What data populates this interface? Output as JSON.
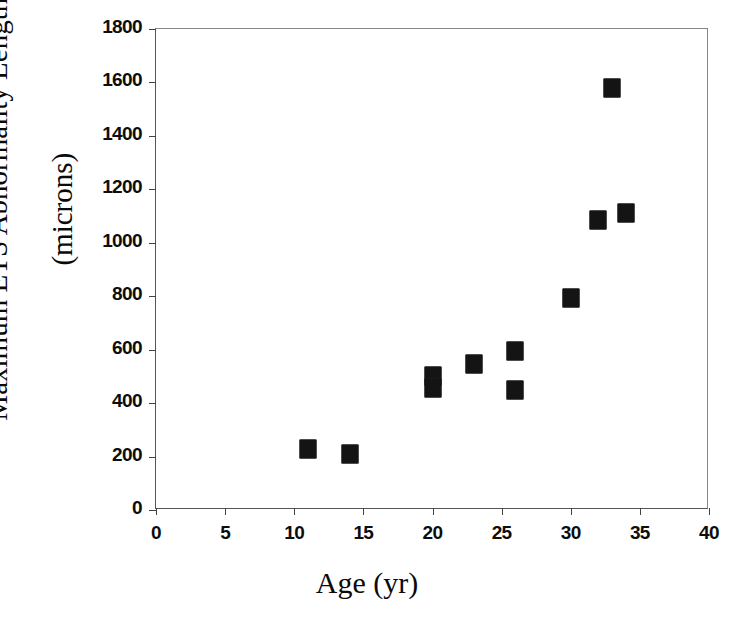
{
  "chart_data": {
    "type": "scatter",
    "title": "",
    "xlabel": "Age (yr)",
    "ylabel_line1": "Maximum ETS Abnormality Length",
    "ylabel_line2": "(microns)",
    "xlim": [
      0,
      40
    ],
    "ylim": [
      0,
      1800
    ],
    "xticks": [
      0,
      5,
      10,
      15,
      20,
      25,
      30,
      35,
      40
    ],
    "yticks": [
      0,
      200,
      400,
      600,
      800,
      1000,
      1200,
      1400,
      1600,
      1800
    ],
    "xtick_labels": [
      "0",
      "5",
      "10",
      "15",
      "20",
      "25",
      "30",
      "35",
      "40"
    ],
    "ytick_labels": [
      "0",
      "200",
      "400",
      "600",
      "800",
      "1000",
      "1200",
      "1400",
      "1600",
      "1800"
    ],
    "grid": false,
    "legend": false,
    "marker_shape": "filled-square",
    "marker_color": "#141414",
    "points": [
      {
        "x": 11,
        "y": 230
      },
      {
        "x": 14,
        "y": 210
      },
      {
        "x": 20,
        "y": 500
      },
      {
        "x": 20,
        "y": 455
      },
      {
        "x": 23,
        "y": 545
      },
      {
        "x": 26,
        "y": 595
      },
      {
        "x": 26,
        "y": 450
      },
      {
        "x": 30,
        "y": 795
      },
      {
        "x": 32,
        "y": 1085
      },
      {
        "x": 33,
        "y": 1580
      },
      {
        "x": 34,
        "y": 1110
      }
    ]
  }
}
